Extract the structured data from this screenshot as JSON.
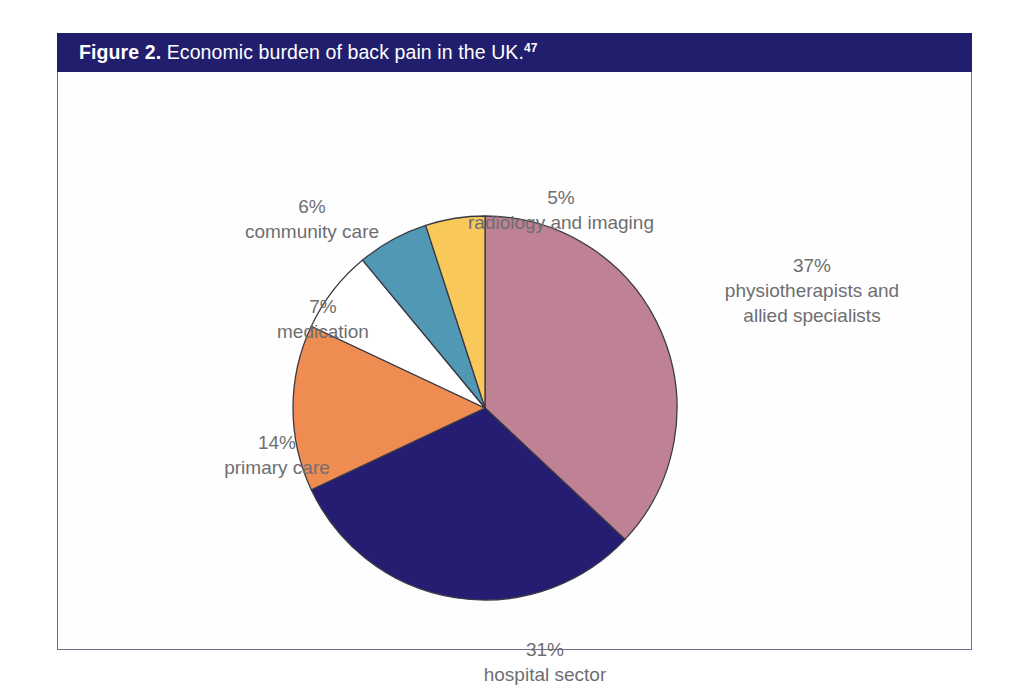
{
  "figure": {
    "label": "Figure 2.",
    "caption": " Economic burden of back pain in the UK.",
    "reference": "47",
    "header_color": "#221e6e",
    "frame_border_color": "#6f6f8d",
    "label_text_color": "#6e6e70"
  },
  "chart_data": {
    "type": "pie",
    "title": "Economic burden of back pain in the UK.",
    "xlabel": "",
    "ylabel": "",
    "legend_position": "none",
    "grid": false,
    "start_angle_deg": 0,
    "direction": "clockwise",
    "categories": [
      "physiotherapists and allied specialists",
      "hospital sector",
      "primary care",
      "medication",
      "community care",
      "radiology and imaging"
    ],
    "values": [
      37,
      31,
      14,
      7,
      6,
      5
    ],
    "unit": "%",
    "colors": [
      "#bf8194",
      "#241d72",
      "#ef8c51",
      "#ffffff",
      "#5098b4",
      "#f9c85a"
    ],
    "slice_outline_color": "#3a3a44",
    "slices": [
      {
        "name": "physiotherapists and allied specialists",
        "value": 37,
        "pct_label": "37%",
        "name_line1": "physiotherapists and",
        "name_line2": "allied specialists",
        "color": "#bf8194"
      },
      {
        "name": "hospital sector",
        "value": 31,
        "pct_label": "31%",
        "name_line1": "hospital sector",
        "name_line2": "",
        "color": "#241d72"
      },
      {
        "name": "primary care",
        "value": 14,
        "pct_label": "14%",
        "name_line1": "primary care",
        "name_line2": "",
        "color": "#ef8c51"
      },
      {
        "name": "medication",
        "value": 7,
        "pct_label": "7%",
        "name_line1": "medication",
        "name_line2": "",
        "color": "#ffffff"
      },
      {
        "name": "community care",
        "value": 6,
        "pct_label": "6%",
        "name_line1": "community care",
        "name_line2": "",
        "color": "#5098b4"
      },
      {
        "name": "radiology and imaging",
        "value": 5,
        "pct_label": "5%",
        "name_line1": "radiology and imaging",
        "name_line2": "",
        "color": "#f9c85a"
      }
    ]
  }
}
